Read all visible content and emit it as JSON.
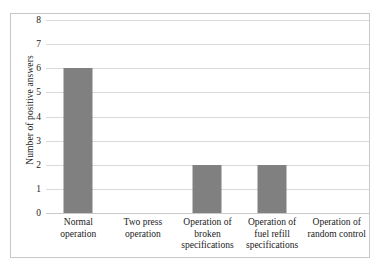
{
  "chart_data": {
    "type": "bar",
    "title": "",
    "xlabel": "",
    "ylabel": "Number of positive answers",
    "categories": [
      "Normal operation",
      "Two press operation",
      "Operation of broken specifications",
      "Operation of fuel refill specifications",
      "Operation of random control"
    ],
    "values": [
      6,
      0,
      2,
      2,
      0
    ],
    "ylim": [
      0,
      8
    ],
    "yticks": [
      0,
      1,
      2,
      3,
      4,
      5,
      6,
      7,
      8
    ],
    "grid": "horizontal",
    "legend": "none",
    "bar_color": "#808080",
    "grid_color": "#d9d9d9",
    "border_color": "#c8c8c8"
  }
}
